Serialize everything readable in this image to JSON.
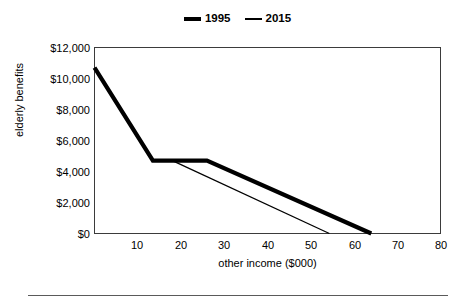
{
  "chart_data": {
    "type": "line",
    "title": "",
    "xlabel": "other income ($000)",
    "ylabel": "elderly benefits",
    "xlim": [
      0,
      80
    ],
    "ylim": [
      0,
      12000
    ],
    "xticks": [
      10,
      20,
      30,
      40,
      50,
      60,
      70,
      80
    ],
    "xtick_labels": [
      "10",
      "20",
      "30",
      "40",
      "50",
      "60",
      "70",
      "80"
    ],
    "yticks": [
      0,
      2000,
      4000,
      6000,
      8000,
      10000,
      12000
    ],
    "ytick_labels": [
      "$0",
      "$2,000",
      "$4,000",
      "$6,000",
      "$8,000",
      "$10,000",
      "$12,000"
    ],
    "grid": false,
    "legend_position": "top-center",
    "series": [
      {
        "name": "1995",
        "style": "thick",
        "color": "#000000",
        "points": [
          {
            "x": 0,
            "y": 10700
          },
          {
            "x": 13.5,
            "y": 4700
          },
          {
            "x": 26.0,
            "y": 4700
          },
          {
            "x": 64.0,
            "y": 0
          }
        ]
      },
      {
        "name": "2015",
        "style": "thin",
        "color": "#000000",
        "points": [
          {
            "x": 18.0,
            "y": 4700
          },
          {
            "x": 54.3,
            "y": 0
          }
        ]
      }
    ]
  },
  "legend": {
    "entries": [
      {
        "label": "1995",
        "swatch": "thick-line-swatch"
      },
      {
        "label": "2015",
        "swatch": "thin-line-swatch"
      }
    ]
  },
  "axes": {
    "y_title": "elderly benefits",
    "x_title": "other income ($000)",
    "y_tick_labels": [
      "$12,000",
      "$10,000",
      "$8,000",
      "$6,000",
      "$4,000",
      "$2,000",
      "$0"
    ],
    "x_tick_labels": [
      "10",
      "20",
      "30",
      "40",
      "50",
      "60",
      "70",
      "80"
    ]
  },
  "colors": {
    "line": "#000000",
    "axis": "#3b3b3b",
    "background": "#ffffff",
    "rule": "#5a5a5a"
  }
}
